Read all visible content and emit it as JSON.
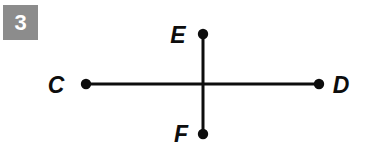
{
  "page": {
    "background_color": "#ffffff",
    "width": 372,
    "height": 160
  },
  "badge": {
    "label": "3",
    "background_color": "#8c8c8c",
    "text_color": "#ffffff"
  },
  "figure": {
    "name": "intersecting-segments-diagram",
    "stroke_color": "#0d0d0d",
    "line_width": 3,
    "dot_radius": 5,
    "points": [
      {
        "id": "C",
        "label": "C",
        "x": 86,
        "y": 84,
        "label_x": 56,
        "label_y": 93
      },
      {
        "id": "D",
        "label": "D",
        "x": 319,
        "y": 84,
        "label_x": 331,
        "label_y": 93
      },
      {
        "id": "E",
        "label": "E",
        "x": 203,
        "y": 34,
        "label_x": 168,
        "label_y": 43
      },
      {
        "id": "F",
        "label": "F",
        "x": 203,
        "y": 134,
        "label_x": 172,
        "label_y": 142
      }
    ],
    "segments": [
      {
        "id": "CD",
        "from": "C",
        "to": "D",
        "x1": 86,
        "y1": 84,
        "x2": 319,
        "y2": 84
      },
      {
        "id": "EF",
        "from": "E",
        "to": "F",
        "x1": 203,
        "y1": 34,
        "x2": 203,
        "y2": 134
      }
    ],
    "intersection": {
      "x": 203,
      "y": 84
    }
  }
}
